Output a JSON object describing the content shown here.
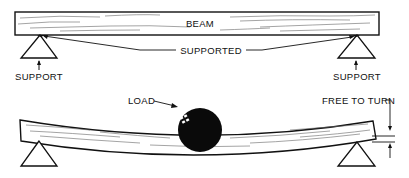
{
  "diagram": {
    "top": {
      "beam_label": "BEAM",
      "supported_label": "SUPPORTED",
      "left_support_label": "SUPPORT",
      "right_support_label": "SUPPORT"
    },
    "bottom": {
      "load_label": "LOAD",
      "free_to_turn_label": "FREE TO TURN"
    },
    "colors": {
      "ink": "#111111",
      "background": "#ffffff",
      "wood_grain": "#555555"
    }
  }
}
